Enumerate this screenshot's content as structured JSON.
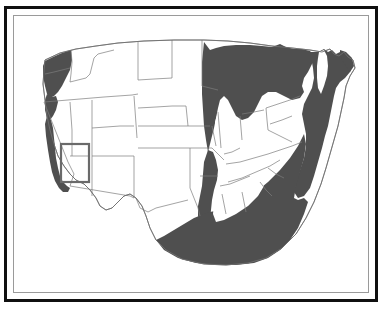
{
  "figure": {
    "kind": "range-distribution-map",
    "region": "Contiguous United States",
    "frame": {
      "outer_border_color": "#101010",
      "inner_rule_color": "#9a9a9a",
      "background_color": "#ffffff"
    }
  },
  "map": {
    "base_fill": "#ffffff",
    "state_border_color": "#7c7c7c",
    "range_fill_color": "#4f4f4f",
    "highlight_box": {
      "label": "study-area-box",
      "stroke_color": "#6a6a6a",
      "x": 47,
      "y": 128,
      "width": 28,
      "height": 38
    }
  },
  "shaded_regions": [
    {
      "name": "pacific-northwest-coast",
      "fill": "#4f4f4f"
    },
    {
      "name": "california-coast-strip",
      "fill": "#4f4f4f"
    },
    {
      "name": "upper-midwest-great-lakes",
      "fill": "#4f4f4f"
    },
    {
      "name": "northeast-atlantic-seaboard",
      "fill": "#4f4f4f"
    },
    {
      "name": "lower-mississippi-valley",
      "fill": "#4f4f4f"
    },
    {
      "name": "southeast-gulf-coast",
      "fill": "#4f4f4f"
    }
  ],
  "unshaded_regions": [
    {
      "name": "great-basin-interior-west"
    },
    {
      "name": "great-plains"
    },
    {
      "name": "texas"
    },
    {
      "name": "ohio-valley-interior"
    },
    {
      "name": "tennessee-valley-interior"
    }
  ]
}
